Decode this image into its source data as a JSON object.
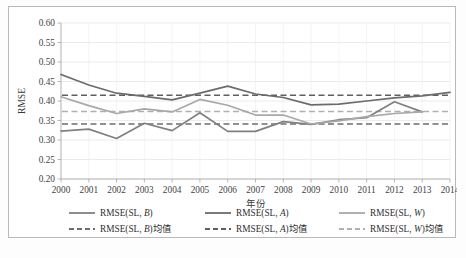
{
  "chart_data": {
    "type": "line",
    "title": "",
    "xlabel": "年份",
    "ylabel": "RMSE",
    "ylim": [
      0.2,
      0.6
    ],
    "ytick_step": 0.05,
    "yticks": [
      "0.60",
      "0.55",
      "0.50",
      "0.45",
      "0.40",
      "0.35",
      "0.30",
      "0.25",
      "0.20"
    ],
    "ytick_values": [
      0.6,
      0.55,
      0.5,
      0.45,
      0.4,
      0.35,
      0.3,
      0.25,
      0.2
    ],
    "grid": true,
    "legend_position": "bottom",
    "categories": [
      2000,
      2001,
      2002,
      2003,
      2004,
      2005,
      2006,
      2007,
      2008,
      2009,
      2010,
      2011,
      2012,
      2013,
      2014
    ],
    "xtick_labels": [
      "2000",
      "2001",
      "2002",
      "2003",
      "2004",
      "2005",
      "2006",
      "2007",
      "2008",
      "2009",
      "2010",
      "2011",
      "2012",
      "2013",
      "2014"
    ],
    "series": [
      {
        "name": "RMSE(SL, B)",
        "style": "solid",
        "color": "#808080",
        "x": [
          2000,
          2001,
          2002,
          2003,
          2004,
          2005,
          2006,
          2007,
          2008,
          2009,
          2010,
          2011,
          2012,
          2013
        ],
        "values": [
          0.323,
          0.328,
          0.304,
          0.343,
          0.324,
          0.37,
          0.322,
          0.322,
          0.347,
          0.34,
          0.352,
          0.357,
          0.398,
          0.372
        ]
      },
      {
        "name": "RMSE(SL, A)",
        "style": "solid",
        "color": "#6b6b6b",
        "x": [
          2000,
          2001,
          2002,
          2003,
          2004,
          2005,
          2006,
          2007,
          2008,
          2009,
          2010,
          2011,
          2012,
          2013,
          2014
        ],
        "values": [
          0.468,
          0.441,
          0.42,
          0.412,
          0.403,
          0.42,
          0.438,
          0.418,
          0.409,
          0.39,
          0.392,
          0.4,
          0.408,
          0.413,
          0.422
        ]
      },
      {
        "name": "RMSE(SL, W)",
        "style": "solid",
        "color": "#a8a8a8",
        "x": [
          2000,
          2001,
          2002,
          2003,
          2004,
          2005,
          2006,
          2007,
          2008,
          2009,
          2010,
          2011,
          2012,
          2013
        ],
        "values": [
          0.411,
          0.388,
          0.368,
          0.38,
          0.372,
          0.404,
          0.389,
          0.364,
          0.364,
          0.341,
          0.349,
          0.36,
          0.368,
          0.372
        ]
      }
    ],
    "mean_lines": [
      {
        "name": "RMSE(SL, B)均值",
        "style": "dashed",
        "color": "#6e6e6e",
        "value": 0.341
      },
      {
        "name": "RMSE(SL, A)均值",
        "style": "dashed",
        "color": "#5f5f5f",
        "value": 0.415
      },
      {
        "name": "RMSE(SL, W)均值",
        "style": "dashed",
        "color": "#b0b0b0",
        "value": 0.373
      }
    ],
    "legend": [
      {
        "label_prefix": "RMSE(SL, ",
        "label_italic": "B",
        "label_suffix": ")",
        "style": "solid",
        "color": "#808080"
      },
      {
        "label_prefix": "RMSE(SL, ",
        "label_italic": "A",
        "label_suffix": ")",
        "style": "solid",
        "color": "#6b6b6b"
      },
      {
        "label_prefix": "RMSE(SL, ",
        "label_italic": "W",
        "label_suffix": ")",
        "style": "solid",
        "color": "#a8a8a8"
      },
      {
        "label_prefix": "RMSE(SL, ",
        "label_italic": "B",
        "label_suffix": ")均值",
        "style": "dashed",
        "color": "#6e6e6e"
      },
      {
        "label_prefix": "RMSE(SL, ",
        "label_italic": "A",
        "label_suffix": ")均值",
        "style": "dashed",
        "color": "#5f5f5f"
      },
      {
        "label_prefix": "RMSE(SL, ",
        "label_italic": "W",
        "label_suffix": ")均值",
        "style": "dashed",
        "color": "#b0b0b0"
      }
    ]
  }
}
